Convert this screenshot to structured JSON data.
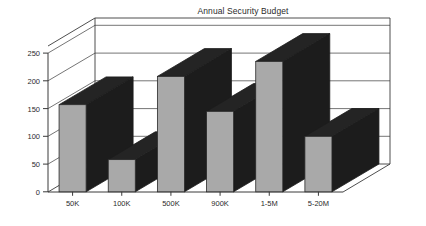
{
  "chart_data": {
    "type": "bar",
    "title": "Annual Security Budget",
    "xlabel": "",
    "ylabel": "",
    "categories": [
      "50K",
      "100K",
      "500K",
      "900K",
      "1-5M",
      "5-20M"
    ],
    "values": [
      157,
      58,
      208,
      145,
      235,
      100
    ],
    "yticks": [
      0,
      50,
      100,
      150,
      200,
      250
    ],
    "ylim": [
      0,
      280
    ],
    "grid": true,
    "legend": false,
    "style": "3d-bar",
    "colors": {
      "bar_front": "#a9a9a9",
      "bar_side": "#1c1c1c",
      "bar_top": "#242424",
      "axis": "#3a3a3a",
      "text": "#2b2b2b",
      "background": "#ffffff"
    }
  },
  "chart": {
    "title": "Annual Security Budget",
    "ytick_labels": [
      "0",
      "50",
      "100",
      "150",
      "200",
      "250"
    ],
    "xtick_labels": [
      "50K",
      "100K",
      "500K",
      "900K",
      "1-5M",
      "5-20M"
    ]
  }
}
